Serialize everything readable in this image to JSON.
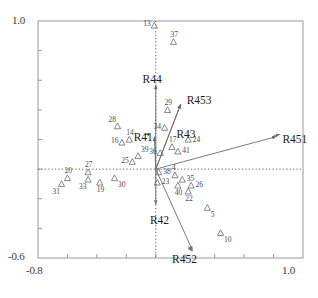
{
  "chart_data": {
    "type": "scatter",
    "title": "",
    "subtitle": "",
    "xlabel": "",
    "ylabel": "",
    "xlim": [
      -0.8,
      1.0
    ],
    "ylim": [
      -0.6,
      1.0
    ],
    "xticks": [
      -0.8,
      1.0
    ],
    "yticks": [
      -0.6,
      1.0
    ],
    "xtick_labels": [
      "-0.8",
      "1.0"
    ],
    "ytick_labels": [
      "-0.6",
      "1.0"
    ],
    "grid": false,
    "reference_lines": {
      "style": "dotted",
      "vertical_at_x": 0.0,
      "horizontal_at_y": 0.0
    },
    "legend": null,
    "marker": "triangle-up-open",
    "marker_color": "#6b6b6b",
    "vector_color": "#6b6b6b",
    "text_color": "#1c1c1c",
    "points": [
      {
        "label": "13",
        "x": -0.01,
        "y": 0.97,
        "label_side": "left"
      },
      {
        "label": "37",
        "x": 0.12,
        "y": 0.86,
        "label_side": "above"
      },
      {
        "label": "29",
        "x": 0.08,
        "y": 0.4,
        "label_side": "above"
      },
      {
        "label": "34",
        "x": 0.06,
        "y": 0.28,
        "label_side": "left"
      },
      {
        "label": "28",
        "x": -0.26,
        "y": 0.29,
        "label_side": "above-left"
      },
      {
        "label": "14",
        "x": -0.18,
        "y": 0.2,
        "label_side": "above"
      },
      {
        "label": "16",
        "x": -0.23,
        "y": 0.18,
        "label_side": "left"
      },
      {
        "label": "39",
        "x": -0.12,
        "y": 0.09,
        "label_side": "above-right"
      },
      {
        "label": "25",
        "x": -0.16,
        "y": 0.05,
        "label_side": "left"
      },
      {
        "label": "17",
        "x": 0.11,
        "y": 0.15,
        "label_side": "above"
      },
      {
        "label": "24",
        "x": 0.22,
        "y": 0.2,
        "label_side": "right"
      },
      {
        "label": "41",
        "x": 0.15,
        "y": 0.12,
        "label_side": "right"
      },
      {
        "label": "36",
        "x": 0.03,
        "y": 0.11,
        "label_side": "left"
      },
      {
        "label": "27",
        "x": -0.46,
        "y": -0.02,
        "label_side": "above"
      },
      {
        "label": "20",
        "x": -0.6,
        "y": -0.06,
        "label_side": "above"
      },
      {
        "label": "31",
        "x": -0.64,
        "y": -0.1,
        "label_side": "below-left"
      },
      {
        "label": "33",
        "x": -0.46,
        "y": -0.07,
        "label_side": "below-left"
      },
      {
        "label": "19",
        "x": -0.38,
        "y": -0.09,
        "label_side": "below"
      },
      {
        "label": "30",
        "x": -0.28,
        "y": -0.06,
        "label_side": "below-right"
      },
      {
        "label": "38",
        "x": 0.02,
        "y": -0.02,
        "label_side": "right"
      },
      {
        "label": "23",
        "x": 0.01,
        "y": -0.09,
        "label_side": "right"
      },
      {
        "label": "4",
        "x": 0.13,
        "y": -0.04,
        "label_side": "above"
      },
      {
        "label": "35",
        "x": 0.18,
        "y": -0.07,
        "label_side": "right"
      },
      {
        "label": "40",
        "x": 0.15,
        "y": -0.11,
        "label_side": "below"
      },
      {
        "label": "26",
        "x": 0.24,
        "y": -0.11,
        "label_side": "right"
      },
      {
        "label": "22",
        "x": 0.22,
        "y": -0.15,
        "label_side": "below"
      },
      {
        "label": "5",
        "x": 0.35,
        "y": -0.26,
        "label_side": "below-right"
      },
      {
        "label": "10",
        "x": 0.44,
        "y": -0.43,
        "label_side": "below-right"
      }
    ],
    "vectors": [
      {
        "label": "R44",
        "x0": 0.0,
        "y0": 0.0,
        "x1": 0.0,
        "y1": 0.57,
        "label_x": -0.09,
        "label_y": 0.64
      },
      {
        "label": "R453",
        "x0": 0.0,
        "y0": 0.0,
        "x1": 0.17,
        "y1": 0.44,
        "label_x": 0.21,
        "label_y": 0.5
      },
      {
        "label": "R451",
        "x0": 0.0,
        "y0": 0.0,
        "x1": 0.82,
        "y1": 0.22,
        "label_x": 0.86,
        "label_y": 0.24
      },
      {
        "label": "R43",
        "x0": 0.0,
        "y0": 0.0,
        "x1": 0.17,
        "y1": 0.44,
        "label_x": 0.14,
        "label_y": 0.27
      },
      {
        "label": "R41",
        "x0": 0.0,
        "y0": 0.0,
        "x1": -0.01,
        "y1": 0.22,
        "label_x": -0.15,
        "label_y": 0.25
      },
      {
        "label": "R42",
        "x0": 0.0,
        "y0": 0.0,
        "x1": 0.0,
        "y1": -0.24,
        "label_x": -0.04,
        "label_y": -0.31
      },
      {
        "label": "R452",
        "x0": 0.0,
        "y0": 0.0,
        "x1": 0.25,
        "y1": -0.55,
        "label_x": 0.11,
        "label_y": -0.57
      }
    ]
  }
}
